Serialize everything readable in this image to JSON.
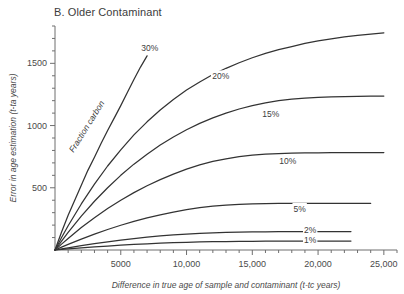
{
  "chart_data": {
    "type": "line",
    "title": "B. Older Contaminant",
    "xlabel": "Difference in true age of sample and contaminant (t-tc years)",
    "ylabel": "Error in age estimation (t-ta years)",
    "xlim": [
      0,
      26000
    ],
    "ylim": [
      0,
      1800
    ],
    "xticks": [
      5000,
      10000,
      15000,
      20000,
      25000
    ],
    "xticklabels": [
      "5000",
      "10,000",
      "15,000",
      "20,000",
      "25,000"
    ],
    "yticks": [
      500,
      1000,
      1500
    ],
    "yticklabels": [
      "500",
      "1000",
      "1500"
    ],
    "xminor_step": 1000,
    "yminor_step": 100,
    "grid": false,
    "legend": "inline-curve-labels",
    "annotations": [
      {
        "text": "Fraction carbon",
        "rotation": -58,
        "x": 2600,
        "y": 980
      }
    ],
    "series": [
      {
        "name": "30%",
        "label": "30%",
        "label_x": 7200,
        "label_y": 1620,
        "x": [
          0,
          500,
          1000,
          1500,
          2000,
          2500,
          3000,
          3500,
          4000,
          4500,
          5000,
          5500,
          6000,
          6500,
          7000
        ],
        "values": [
          0,
          145,
          280,
          400,
          520,
          640,
          745,
          855,
          960,
          1060,
          1160,
          1265,
          1370,
          1470,
          1560
        ]
      },
      {
        "name": "20%",
        "label": "20%",
        "label_x": 12600,
        "label_y": 1395,
        "x": [
          0,
          500,
          1000,
          2000,
          3000,
          4000,
          5000,
          6000,
          7000,
          8000,
          9000,
          10000,
          11000,
          12000,
          13000,
          14000,
          15000,
          16000,
          17000,
          18000,
          19000,
          20000,
          21000,
          22000,
          23000,
          24000,
          25000
        ],
        "values": [
          0,
          100,
          195,
          370,
          530,
          675,
          805,
          925,
          1030,
          1125,
          1210,
          1285,
          1350,
          1410,
          1460,
          1505,
          1545,
          1580,
          1610,
          1635,
          1660,
          1680,
          1697,
          1712,
          1725,
          1735,
          1745
        ]
      },
      {
        "name": "15%",
        "label": "15%",
        "label_x": 16400,
        "label_y": 1090,
        "x": [
          0,
          500,
          1000,
          2000,
          3000,
          4000,
          5000,
          6000,
          7000,
          8000,
          9000,
          10000,
          11000,
          12000,
          13000,
          14000,
          15000,
          16000,
          17000,
          18000,
          19000,
          20000,
          21000,
          22000,
          23000,
          24000,
          25000
        ],
        "values": [
          0,
          72,
          142,
          272,
          392,
          500,
          600,
          690,
          770,
          843,
          908,
          966,
          1018,
          1062,
          1100,
          1133,
          1160,
          1183,
          1200,
          1212,
          1220,
          1226,
          1230,
          1233,
          1235,
          1236,
          1237
        ]
      },
      {
        "name": "10%",
        "label": "10%",
        "label_x": 17700,
        "label_y": 715,
        "x": [
          0,
          500,
          1000,
          2000,
          3000,
          4000,
          5000,
          6000,
          7000,
          8000,
          9000,
          10000,
          11000,
          12000,
          13000,
          14000,
          15000,
          16000,
          17000,
          18000,
          19000,
          20000,
          21000,
          22000,
          23000,
          24000,
          25000
        ],
        "values": [
          0,
          47,
          93,
          180,
          260,
          333,
          400,
          461,
          516,
          565,
          610,
          650,
          684,
          712,
          733,
          750,
          762,
          770,
          775,
          778,
          780,
          781,
          782,
          782,
          783,
          783,
          783
        ]
      },
      {
        "name": "5%",
        "label": "5%",
        "label_x": 18600,
        "label_y": 330,
        "x": [
          0,
          500,
          1000,
          2000,
          3000,
          4000,
          5000,
          6000,
          7000,
          8000,
          9000,
          10000,
          11000,
          12000,
          13000,
          14000,
          15000,
          16000,
          17000,
          18000,
          19000,
          20000,
          21000,
          22000,
          23000,
          24000
        ],
        "values": [
          0,
          23,
          45,
          88,
          128,
          165,
          199,
          230,
          258,
          283,
          305,
          324,
          340,
          352,
          361,
          367,
          371,
          373,
          374,
          375,
          375,
          375,
          375,
          375,
          375,
          375
        ]
      },
      {
        "name": "2%",
        "label": "2%",
        "label_x": 19400,
        "label_y": 158,
        "x": [
          0,
          500,
          1000,
          2000,
          3000,
          4000,
          5000,
          6000,
          7000,
          8000,
          9000,
          10000,
          11000,
          12000,
          13000,
          14000,
          15000,
          16000,
          17000,
          18000,
          19000,
          20000,
          21000,
          22000,
          22500
        ],
        "values": [
          0,
          9,
          18,
          35,
          51,
          66,
          80,
          92,
          103,
          113,
          121,
          128,
          134,
          138,
          141,
          143,
          145,
          146,
          147,
          147,
          148,
          148,
          148,
          148,
          148
        ]
      },
      {
        "name": "1%",
        "label": "1%",
        "label_x": 19400,
        "label_y": 78,
        "x": [
          0,
          500,
          1000,
          2000,
          3000,
          4000,
          5000,
          6000,
          7000,
          8000,
          9000,
          10000,
          11000,
          12000,
          13000,
          14000,
          15000,
          16000,
          17000,
          18000,
          19000,
          20000,
          21000,
          22000,
          22500
        ],
        "values": [
          0,
          4,
          9,
          17,
          25,
          32,
          39,
          45,
          50,
          55,
          59,
          62,
          65,
          67,
          68,
          69,
          70,
          71,
          71,
          72,
          72,
          72,
          72,
          72,
          72
        ]
      }
    ]
  },
  "colors": {
    "curve": "#333333",
    "axis": "#6f6f6f",
    "text": "#3d3d3d",
    "background": "#ffffff"
  }
}
